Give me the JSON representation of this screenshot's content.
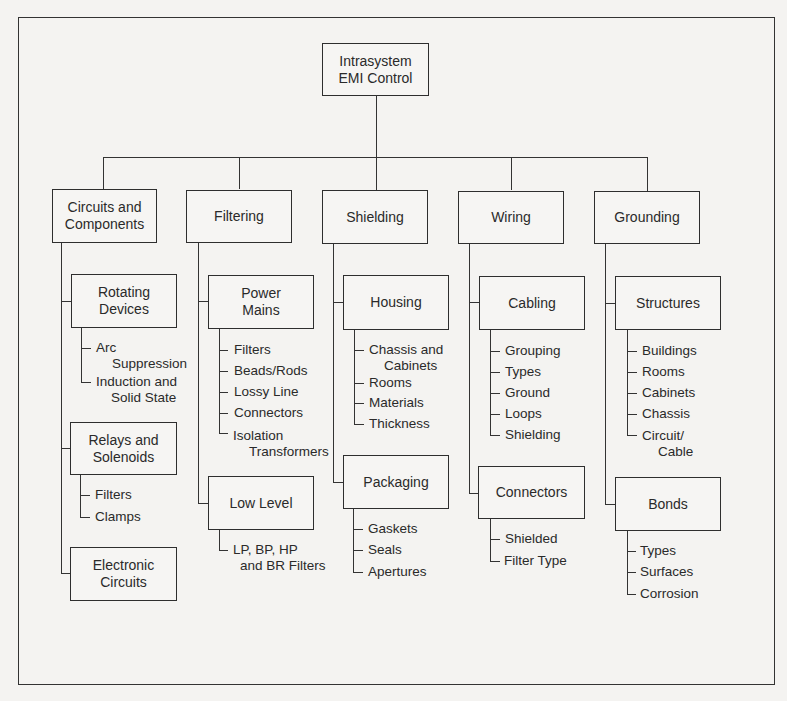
{
  "diagram": {
    "root": {
      "label": "Intrasystem\nEMI Control"
    },
    "categories": [
      {
        "label": "Circuits and\nComponents",
        "groups": [
          {
            "label": "Rotating\nDevices",
            "items": [
              "Arc",
              "Suppression",
              "Induction and",
              "Solid State"
            ]
          },
          {
            "label": "Relays and\nSolenoids",
            "items": [
              "Filters",
              "Clamps"
            ]
          },
          {
            "label": "Electronic\nCircuits",
            "items": []
          }
        ]
      },
      {
        "label": "Filtering",
        "groups": [
          {
            "label": "Power\nMains",
            "items": [
              "Filters",
              "Beads/Rods",
              "Lossy Line",
              "Connectors",
              "Isolation",
              "Transformers"
            ]
          },
          {
            "label": "Low Level",
            "items": [
              "LP, BP, HP",
              "and BR Filters"
            ]
          }
        ]
      },
      {
        "label": "Shielding",
        "groups": [
          {
            "label": "Housing",
            "items": [
              "Chassis and",
              "Cabinets",
              "Rooms",
              "Materials",
              "Thickness"
            ]
          },
          {
            "label": "Packaging",
            "items": [
              "Gaskets",
              "Seals",
              "Apertures"
            ]
          }
        ]
      },
      {
        "label": "Wiring",
        "groups": [
          {
            "label": "Cabling",
            "items": [
              "Grouping",
              "Types",
              "Ground",
              "Loops",
              "Shielding"
            ]
          },
          {
            "label": "Connectors",
            "items": [
              "Shielded",
              "Filter Type"
            ]
          }
        ]
      },
      {
        "label": "Grounding",
        "groups": [
          {
            "label": "Structures",
            "items": [
              "Buildings",
              "Rooms",
              "Cabinets",
              "Chassis",
              "Circuit/",
              "Cable"
            ]
          },
          {
            "label": "Bonds",
            "items": [
              "Types",
              "Surfaces",
              "Corrosion"
            ]
          }
        ]
      }
    ]
  }
}
